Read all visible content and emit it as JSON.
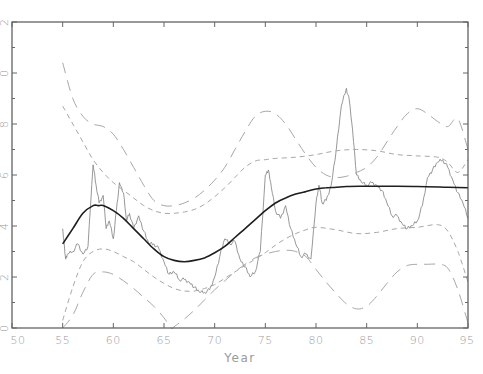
{
  "chart_data": {
    "type": "line",
    "title": "",
    "xlabel": "Year",
    "ylabel": "",
    "xlim": [
      50,
      95
    ],
    "ylim": [
      0,
      12
    ],
    "grid": false,
    "legend": null,
    "x_ticks": [
      "50",
      "55",
      "60",
      "65",
      "70",
      "75",
      "80",
      "85",
      "90",
      "95"
    ],
    "y_ticks_visible_fragments": [
      "2",
      "0",
      "8",
      "6",
      "4",
      "2",
      "0"
    ],
    "y_tick_values": [
      12,
      10,
      8,
      6,
      4,
      2,
      0
    ],
    "series": [
      {
        "name": "observed",
        "style": "thin solid grey, noisy",
        "x": [
          55.0,
          55.3,
          55.5,
          56,
          56.5,
          57,
          57.5,
          58,
          58.3,
          58.6,
          59,
          59.3,
          59.6,
          60,
          60.3,
          60.6,
          61,
          61.3,
          61.6,
          62,
          62.5,
          63,
          63.5,
          64,
          64.5,
          65,
          65.5,
          66,
          66.5,
          67,
          67.5,
          68,
          68.5,
          69,
          69.5,
          70,
          70.5,
          71,
          71.5,
          72,
          72.5,
          73,
          73.5,
          74,
          74.5,
          75,
          75.3,
          75.6,
          76,
          76.5,
          77,
          77.5,
          78,
          78.5,
          79,
          79.5,
          80,
          80.3,
          80.6,
          81,
          81.5,
          82,
          82.5,
          83,
          83.3,
          83.6,
          84,
          84.5,
          85,
          85.5,
          86,
          86.5,
          87,
          87.5,
          88,
          88.5,
          89,
          89.5,
          90,
          90.5,
          91,
          91.5,
          92,
          92.5,
          93,
          93.5,
          94,
          94.5,
          95
        ],
        "y": [
          3.9,
          2.7,
          2.9,
          3.0,
          3.3,
          2.9,
          3.2,
          6.4,
          5.6,
          4.9,
          5.2,
          3.9,
          4.2,
          3.5,
          4.6,
          5.7,
          5.3,
          4.2,
          4.5,
          3.9,
          4.4,
          3.8,
          3.3,
          3.3,
          3.1,
          2.6,
          2.1,
          2.2,
          1.9,
          1.9,
          1.8,
          1.6,
          1.4,
          1.4,
          1.5,
          2.0,
          2.8,
          3.5,
          3.3,
          3.4,
          2.7,
          2.4,
          2.0,
          2.2,
          3.0,
          6.0,
          6.2,
          5.5,
          4.6,
          4.3,
          4.8,
          3.9,
          3.3,
          2.8,
          2.9,
          2.7,
          4.9,
          5.6,
          4.9,
          5.0,
          5.6,
          7.0,
          8.7,
          9.4,
          8.9,
          7.8,
          6.0,
          5.7,
          5.6,
          5.7,
          5.6,
          5.4,
          4.9,
          4.4,
          4.4,
          4.1,
          3.9,
          4.0,
          4.2,
          4.8,
          5.9,
          6.2,
          6.5,
          6.6,
          6.3,
          5.8,
          5.3,
          4.9,
          4.3
        ]
      },
      {
        "name": "smooth-fit",
        "style": "solid black, thicker",
        "x": [
          55,
          56,
          57,
          58,
          58.5,
          59,
          60,
          61,
          62,
          63,
          64,
          65,
          66,
          67,
          68,
          69,
          70,
          71,
          72,
          73,
          74,
          75,
          76,
          77,
          78,
          79,
          80,
          81,
          82,
          83,
          85,
          87,
          90,
          93,
          95
        ],
        "y": [
          3.3,
          3.9,
          4.5,
          4.8,
          4.8,
          4.8,
          4.6,
          4.3,
          3.9,
          3.5,
          3.1,
          2.8,
          2.65,
          2.6,
          2.65,
          2.75,
          2.95,
          3.2,
          3.55,
          3.9,
          4.25,
          4.6,
          4.9,
          5.1,
          5.25,
          5.35,
          5.45,
          5.5,
          5.52,
          5.55,
          5.56,
          5.56,
          5.55,
          5.52,
          5.5
        ]
      },
      {
        "name": "inner-upper-band",
        "style": "short dashed grey",
        "x": [
          55,
          56,
          57,
          58,
          59,
          60,
          61,
          62,
          63,
          64,
          65,
          66,
          67,
          68,
          69,
          70,
          71,
          72,
          73,
          74,
          75,
          76,
          78,
          80,
          82,
          84,
          86,
          88,
          90,
          92,
          93,
          94,
          95
        ],
        "y": [
          8.7,
          8.0,
          7.3,
          6.6,
          6.1,
          5.7,
          5.4,
          5.1,
          4.8,
          4.6,
          4.5,
          4.5,
          4.55,
          4.65,
          4.85,
          5.15,
          5.5,
          5.9,
          6.3,
          6.55,
          6.6,
          6.65,
          6.7,
          6.8,
          6.95,
          7.0,
          6.95,
          6.8,
          6.75,
          6.7,
          6.5,
          6.1,
          6.6
        ]
      },
      {
        "name": "inner-lower-band",
        "style": "short dashed grey",
        "x": [
          55,
          56,
          57,
          58,
          59,
          60,
          61,
          62,
          63,
          64,
          65,
          66,
          67,
          68,
          69,
          70,
          71,
          72,
          73,
          74,
          75,
          76,
          77,
          78,
          79,
          80,
          82,
          84,
          86,
          88,
          90,
          92,
          93,
          94,
          95
        ],
        "y": [
          0.3,
          1.6,
          2.6,
          3.0,
          3.1,
          3.0,
          2.8,
          2.6,
          2.3,
          2.0,
          1.75,
          1.55,
          1.45,
          1.45,
          1.55,
          1.7,
          1.95,
          2.2,
          2.45,
          2.7,
          2.95,
          3.25,
          3.5,
          3.7,
          3.85,
          3.95,
          3.85,
          3.7,
          3.75,
          3.9,
          3.95,
          4.05,
          3.8,
          3.0,
          1.8
        ]
      },
      {
        "name": "outer-upper-band",
        "style": "long dashed grey",
        "x": [
          55,
          56,
          57,
          58,
          59,
          60,
          61,
          62,
          63,
          64,
          65,
          66,
          67,
          68,
          69,
          70,
          71,
          72,
          73,
          74,
          75,
          76,
          77,
          78,
          79,
          80,
          81,
          82,
          83,
          84,
          85,
          86,
          87,
          88,
          89,
          90,
          91,
          92,
          93,
          94,
          95
        ],
        "y": [
          10.4,
          9.0,
          8.3,
          8.0,
          7.9,
          7.6,
          7.0,
          6.3,
          5.6,
          5.0,
          4.8,
          4.8,
          4.9,
          5.1,
          5.4,
          5.8,
          6.3,
          7.0,
          7.7,
          8.3,
          8.5,
          8.4,
          8.0,
          7.4,
          6.8,
          6.3,
          6.0,
          5.9,
          5.95,
          6.1,
          6.3,
          6.7,
          7.3,
          7.9,
          8.4,
          8.6,
          8.4,
          8.1,
          7.9,
          8.2,
          7.0
        ]
      },
      {
        "name": "outer-lower-band",
        "style": "long dashed grey",
        "x": [
          55,
          56,
          57,
          58,
          59,
          60,
          61,
          62,
          63,
          64,
          65,
          65.7,
          66,
          67,
          68,
          69,
          70,
          71,
          72,
          73,
          74,
          75,
          76,
          77,
          78,
          79,
          80,
          81,
          82,
          83,
          84,
          85,
          86,
          87,
          88,
          89,
          90,
          91,
          92,
          93,
          94,
          95
        ],
        "y": [
          0.0,
          0.5,
          1.4,
          2.1,
          2.2,
          2.1,
          1.85,
          1.55,
          1.2,
          0.85,
          0.4,
          0.0,
          0.05,
          0.35,
          0.7,
          1.1,
          1.5,
          1.85,
          2.2,
          2.5,
          2.75,
          2.9,
          3.0,
          3.05,
          3.0,
          2.8,
          2.3,
          1.8,
          1.35,
          0.95,
          0.75,
          0.85,
          1.25,
          1.75,
          2.2,
          2.45,
          2.5,
          2.5,
          2.5,
          2.35,
          1.5,
          0.2
        ]
      }
    ]
  }
}
